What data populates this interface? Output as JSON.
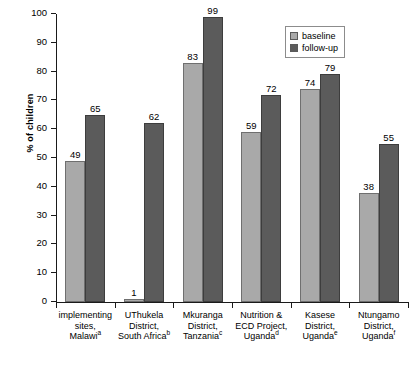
{
  "chart_data": {
    "type": "bar",
    "title": "",
    "xlabel": "",
    "ylabel": "% of children",
    "ylim": [
      0,
      100
    ],
    "yticks": [
      0,
      10,
      20,
      30,
      40,
      50,
      60,
      70,
      80,
      90,
      100
    ],
    "ytick_labels": [
      "0",
      "10",
      "20",
      "30",
      "40",
      "50",
      "60",
      "70",
      "80",
      "90",
      "100"
    ],
    "grid": false,
    "legend_position": "top-right",
    "categories": [
      {
        "lines": [
          "implementing",
          "sites,",
          "Malawi"
        ],
        "superscript": "a"
      },
      {
        "lines": [
          "UThukela",
          "District,",
          "South Africa"
        ],
        "superscript": "b"
      },
      {
        "lines": [
          "Mkuranga",
          "District,",
          "Tanzania"
        ],
        "superscript": "c"
      },
      {
        "lines": [
          "Nutrition &",
          "ECD Project,",
          "Uganda"
        ],
        "superscript": "d"
      },
      {
        "lines": [
          "Kasese",
          "District,",
          "Uganda"
        ],
        "superscript": "e"
      },
      {
        "lines": [
          "Ntungamo",
          "District,",
          "Uganda"
        ],
        "superscript": "f"
      }
    ],
    "series": [
      {
        "name": "baseline",
        "color": "#a9a9a9",
        "values": [
          49,
          1,
          83,
          59,
          74,
          38
        ]
      },
      {
        "name": "follow-up",
        "color": "#5b5b5b",
        "values": [
          65,
          62,
          99,
          72,
          79,
          55
        ]
      }
    ]
  },
  "legend": {
    "items": [
      {
        "label": "baseline"
      },
      {
        "label": "follow-up"
      }
    ]
  },
  "caption": {
    "sliver": ""
  }
}
